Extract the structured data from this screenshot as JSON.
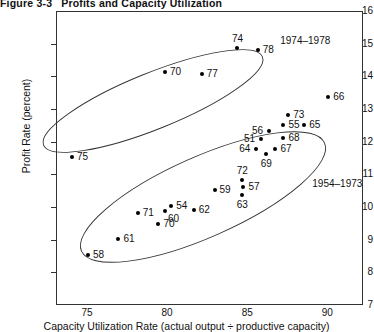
{
  "figure": {
    "number": "Figure 3-3",
    "caption": "Profits and Capacity Utilization"
  },
  "chart_data": {
    "type": "scatter",
    "title": "Profits and Capacity Utilization",
    "xlabel": "Capacity Utilization Rate (actual output ÷ productive capacity)",
    "ylabel": "Profit Rate (percent)",
    "xlim": [
      72,
      91.5
    ],
    "ylim": [
      7,
      16
    ],
    "xticks": [
      75,
      80,
      85,
      90
    ],
    "yticks": [
      7,
      8,
      9,
      10,
      11,
      12,
      13,
      14,
      15,
      16
    ],
    "grid": false,
    "legend": "none",
    "point_label_key": "two-digit year",
    "series": [
      {
        "name": "1974–1978",
        "group_label": "1974–1978",
        "points": [
          {
            "label": "74",
            "x": 84.3,
            "y": 14.9,
            "label_pos": "above"
          },
          {
            "label": "78",
            "x": 85.6,
            "y": 14.85,
            "label_pos": "right"
          },
          {
            "label": "77",
            "x": 82.1,
            "y": 14.1,
            "label_pos": "right"
          },
          {
            "label": "70",
            "x": 79.8,
            "y": 14.15,
            "label_pos": "right"
          },
          {
            "label": "75",
            "x": 74.0,
            "y": 11.55,
            "label_pos": "right"
          }
        ]
      },
      {
        "name": "1954–1973",
        "group_label": "1954–1973",
        "points": [
          {
            "label": "66",
            "x": 90.0,
            "y": 13.4,
            "label_pos": "right"
          },
          {
            "label": "73",
            "x": 87.5,
            "y": 12.85,
            "label_pos": "right"
          },
          {
            "label": "55",
            "x": 87.2,
            "y": 12.55,
            "label_pos": "right"
          },
          {
            "label": "65",
            "x": 88.5,
            "y": 12.55,
            "label_pos": "right"
          },
          {
            "label": "56",
            "x": 86.3,
            "y": 12.35,
            "label_pos": "left"
          },
          {
            "label": "68",
            "x": 87.2,
            "y": 12.15,
            "label_pos": "right"
          },
          {
            "label": "51",
            "x": 85.8,
            "y": 12.1,
            "label_pos": "left"
          },
          {
            "label": "67",
            "x": 86.7,
            "y": 11.8,
            "label_pos": "right"
          },
          {
            "label": "64",
            "x": 85.5,
            "y": 11.8,
            "label_pos": "left"
          },
          {
            "label": "69",
            "x": 86.1,
            "y": 11.65,
            "label_pos": "below"
          },
          {
            "label": "72",
            "x": 84.6,
            "y": 10.85,
            "label_pos": "above"
          },
          {
            "label": "57",
            "x": 84.7,
            "y": 10.65,
            "label_pos": "right"
          },
          {
            "label": "63",
            "x": 84.6,
            "y": 10.4,
            "label_pos": "below"
          },
          {
            "label": "59",
            "x": 82.9,
            "y": 10.55,
            "label_pos": "right"
          },
          {
            "label": "54",
            "x": 80.2,
            "y": 10.05,
            "label_pos": "right"
          },
          {
            "label": "60",
            "x": 79.8,
            "y": 9.9,
            "label_pos": "below-right"
          },
          {
            "label": "62",
            "x": 81.6,
            "y": 9.95,
            "label_pos": "right"
          },
          {
            "label": "71",
            "x": 78.1,
            "y": 9.85,
            "label_pos": "right"
          },
          {
            "label": "70",
            "x": 79.4,
            "y": 9.5,
            "label_pos": "right"
          },
          {
            "label": "61",
            "x": 76.9,
            "y": 9.05,
            "label_pos": "right"
          },
          {
            "label": "58",
            "x": 75.0,
            "y": 8.55,
            "label_pos": "right"
          }
        ]
      }
    ],
    "annotations": [
      {
        "text": "1974–1978",
        "x": 87.0,
        "y": 15.1
      },
      {
        "text": "1954–1973",
        "x": 89.0,
        "y": 10.75
      }
    ]
  }
}
